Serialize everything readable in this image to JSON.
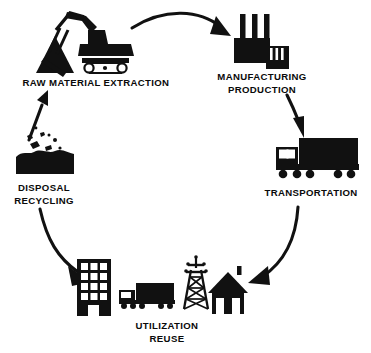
{
  "diagram": {
    "type": "circular-lifecycle",
    "title": "",
    "background_color": "#ffffff",
    "ink_color": "#111111",
    "direction": "clockwise",
    "stage_count": 5,
    "stages": [
      {
        "id": "raw-material-extraction",
        "label_lines": [
          "RAW MATERIAL EXTRACTION"
        ],
        "icon": "excavator-icon",
        "position": "top-left",
        "label_x": 96,
        "label_y": 84,
        "icon_cx": 96,
        "icon_cy": 42
      },
      {
        "id": "manufacturing-production",
        "label_lines": [
          "MANUFACTURING",
          "PRODUCTION"
        ],
        "icon": "factory-icon",
        "position": "top-right",
        "label_x": 262,
        "label_y": 80,
        "icon_cx": 262,
        "icon_cy": 40
      },
      {
        "id": "transportation",
        "label_lines": [
          "TRANSPORTATION"
        ],
        "icon": "truck-icon",
        "position": "right",
        "label_x": 311,
        "label_y": 196,
        "icon_cx": 311,
        "icon_cy": 162
      },
      {
        "id": "utilization-reuse",
        "label_lines": [
          "UTILIZATION",
          "REUSE"
        ],
        "icon": "building-truck-pylon-house-icons",
        "position": "bottom",
        "label_x": 167,
        "label_y": 329,
        "icon_cx": 167,
        "icon_cy": 288
      },
      {
        "id": "disposal-recycling",
        "label_lines": [
          "DISPOSAL",
          "RECYCLING"
        ],
        "icon": "waste-pile-icon",
        "position": "left",
        "label_x": 44,
        "label_y": 191,
        "icon_cx": 44,
        "icon_cy": 158
      }
    ],
    "arrows": [
      {
        "id": "arrow-extraction-to-manufacturing",
        "from": "raw-material-extraction",
        "to": "manufacturing-production",
        "style": "curved",
        "direction": "right-down"
      },
      {
        "id": "arrow-manufacturing-to-transportation",
        "from": "manufacturing-production",
        "to": "transportation",
        "style": "curved",
        "direction": "down"
      },
      {
        "id": "arrow-transportation-to-utilization",
        "from": "transportation",
        "to": "utilization-reuse",
        "style": "curved",
        "direction": "down-left"
      },
      {
        "id": "arrow-disposal-to-utilization",
        "from": "disposal-recycling",
        "to": "utilization-reuse",
        "style": "curved",
        "direction": "down-right"
      },
      {
        "id": "arrow-disposal-to-extraction",
        "from": "disposal-recycling",
        "to": "raw-material-extraction",
        "style": "straight",
        "direction": "up-right"
      }
    ],
    "utilization_icons": [
      {
        "id": "office-building",
        "name": "office-building-icon"
      },
      {
        "id": "delivery-truck",
        "name": "delivery-truck-icon"
      },
      {
        "id": "power-pylon",
        "name": "power-pylon-icon"
      },
      {
        "id": "house",
        "name": "house-icon"
      }
    ]
  }
}
